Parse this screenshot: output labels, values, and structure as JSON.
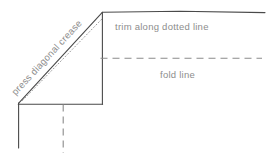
{
  "diagram": {
    "colors": {
      "line": "#4a4a4a",
      "dotted": "#9a9a9a",
      "dashed": "#8a8a8a",
      "text": "#8d8d8d",
      "background": "#ffffff"
    },
    "labels": {
      "diagonal_crease": "press diagonal crease",
      "trim": "trim along dotted line",
      "fold": "fold line"
    },
    "geometry": {
      "apex": {
        "x": 102,
        "y": 12
      },
      "corner": {
        "x": 18,
        "y": 103
      },
      "top_edge_end_x": 265,
      "fold_line_y": 58,
      "fold_line_end_x": 262,
      "base_y": 104,
      "left_vertical_end_y": 148,
      "dashed_vertical_x": 63,
      "dashed_vertical_end_y": 153
    }
  }
}
